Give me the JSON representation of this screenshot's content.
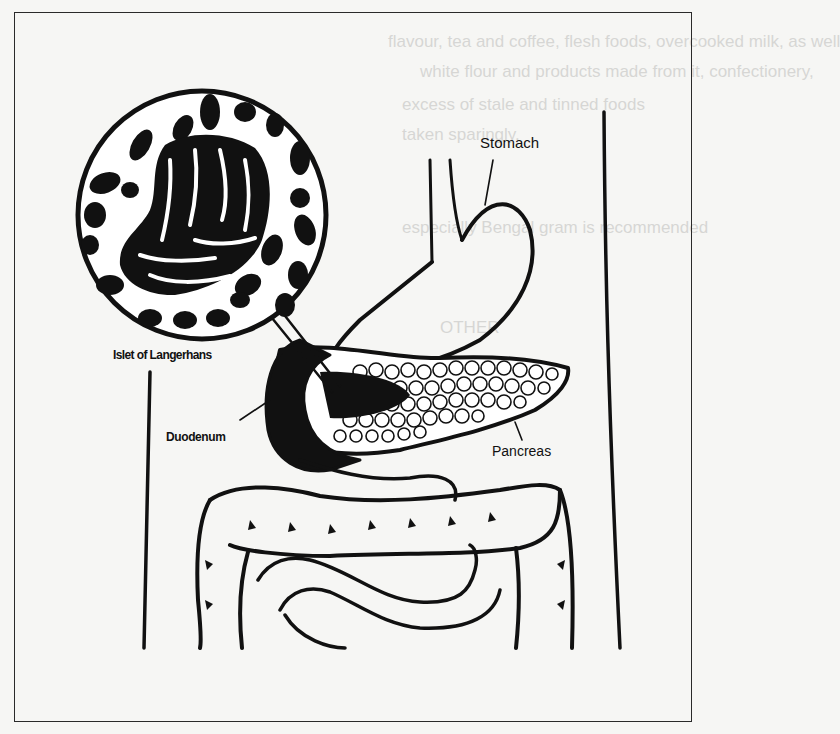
{
  "figure": {
    "labels": {
      "stomach": "Stomach",
      "islet": "Islet of Langerhans",
      "duodenum": "Duodenum",
      "pancreas": "Pancreas"
    },
    "colors": {
      "ink": "#111111",
      "paper": "#f6f6f4",
      "bleed_through": "#d6d6d4"
    }
  },
  "bleed_through_text": [
    "flavour, tea and coffee, flesh foods, overcooked milk, as well",
    "white flour and products made from it, confectionery,",
    "excess of stale and tinned foods",
    "taken sparingly.",
    "especially Bengal gram is recommended",
    "OTHER"
  ]
}
